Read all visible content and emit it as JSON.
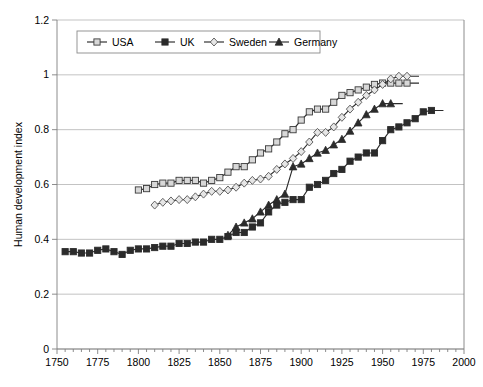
{
  "chart_data": {
    "type": "line",
    "title": "",
    "xlabel": "",
    "ylabel": "Human development index",
    "xlim": [
      1750,
      2000
    ],
    "ylim": [
      0,
      1.2
    ],
    "xticks": [
      1750,
      1775,
      1800,
      1825,
      1850,
      1875,
      1900,
      1925,
      1950,
      1975,
      2000
    ],
    "yticks": [
      0,
      0.2,
      0.4,
      0.6,
      0.8,
      1,
      1.2
    ],
    "xtick_labels": [
      "1750",
      "1775",
      "1800",
      "1825",
      "1850",
      "1875",
      "1900",
      "1925",
      "1950",
      "1975",
      "2000"
    ],
    "ytick_labels": [
      "0",
      "0.2",
      "0.4",
      "0.6",
      "0.8",
      "1",
      "1.2"
    ],
    "minor_xtick_step": 5,
    "grid": "horizontal",
    "legend_position": "top-center",
    "series": [
      {
        "name": "USA",
        "marker": "open-square",
        "color": "#2b2b2b",
        "marker_fill": "#d8d8d8",
        "x": [
          1800,
          1805,
          1810,
          1815,
          1820,
          1825,
          1830,
          1835,
          1840,
          1845,
          1850,
          1855,
          1860,
          1865,
          1870,
          1875,
          1880,
          1885,
          1890,
          1895,
          1900,
          1905,
          1910,
          1915,
          1920,
          1925,
          1930,
          1935,
          1940,
          1945,
          1950,
          1955,
          1960,
          1965
        ],
        "y": [
          0.58,
          0.585,
          0.6,
          0.605,
          0.605,
          0.615,
          0.615,
          0.615,
          0.605,
          0.615,
          0.625,
          0.645,
          0.665,
          0.665,
          0.69,
          0.715,
          0.73,
          0.755,
          0.785,
          0.8,
          0.835,
          0.865,
          0.875,
          0.875,
          0.9,
          0.925,
          0.935,
          0.945,
          0.955,
          0.965,
          0.97,
          0.97,
          0.97,
          0.97
        ]
      },
      {
        "name": "UK",
        "marker": "filled-square",
        "color": "#2b2b2b",
        "marker_fill": "#2b2b2b",
        "x": [
          1755,
          1760,
          1765,
          1770,
          1775,
          1780,
          1785,
          1790,
          1795,
          1800,
          1805,
          1810,
          1815,
          1820,
          1825,
          1830,
          1835,
          1840,
          1845,
          1850,
          1855,
          1860,
          1865,
          1870,
          1875,
          1880,
          1885,
          1890,
          1895,
          1900,
          1905,
          1910,
          1915,
          1920,
          1925,
          1930,
          1935,
          1940,
          1945,
          1950,
          1955,
          1960,
          1965,
          1970,
          1975,
          1980
        ],
        "y": [
          0.355,
          0.355,
          0.35,
          0.35,
          0.36,
          0.365,
          0.355,
          0.345,
          0.36,
          0.365,
          0.365,
          0.37,
          0.375,
          0.375,
          0.385,
          0.385,
          0.39,
          0.39,
          0.4,
          0.4,
          0.41,
          0.425,
          0.425,
          0.445,
          0.46,
          0.5,
          0.525,
          0.535,
          0.545,
          0.545,
          0.59,
          0.6,
          0.615,
          0.64,
          0.655,
          0.685,
          0.7,
          0.715,
          0.715,
          0.76,
          0.8,
          0.81,
          0.825,
          0.84,
          0.865,
          0.87
        ]
      },
      {
        "name": "Sweden",
        "marker": "open-diamond",
        "color": "#606060",
        "marker_fill": "#e6e6e6",
        "x": [
          1810,
          1815,
          1820,
          1825,
          1830,
          1835,
          1840,
          1845,
          1850,
          1855,
          1860,
          1865,
          1870,
          1875,
          1880,
          1885,
          1890,
          1895,
          1900,
          1905,
          1910,
          1915,
          1920,
          1925,
          1930,
          1935,
          1940,
          1945,
          1950,
          1955,
          1960,
          1965
        ],
        "y": [
          0.525,
          0.535,
          0.54,
          0.545,
          0.545,
          0.555,
          0.565,
          0.575,
          0.575,
          0.58,
          0.59,
          0.605,
          0.615,
          0.62,
          0.63,
          0.655,
          0.675,
          0.695,
          0.72,
          0.755,
          0.79,
          0.79,
          0.81,
          0.845,
          0.875,
          0.9,
          0.925,
          0.945,
          0.965,
          0.985,
          0.995,
          0.995
        ]
      },
      {
        "name": "Germany",
        "marker": "filled-triangle",
        "color": "#2b2b2b",
        "marker_fill": "#2b2b2b",
        "x": [
          1855,
          1860,
          1865,
          1870,
          1875,
          1880,
          1885,
          1890,
          1895,
          1900,
          1905,
          1910,
          1915,
          1920,
          1925,
          1930,
          1935,
          1940,
          1945,
          1950,
          1955
        ],
        "y": [
          0.415,
          0.445,
          0.46,
          0.475,
          0.5,
          0.525,
          0.545,
          0.565,
          0.665,
          0.675,
          0.695,
          0.715,
          0.725,
          0.745,
          0.765,
          0.795,
          0.825,
          0.855,
          0.875,
          0.895,
          0.895
        ]
      }
    ]
  },
  "legend": {
    "items": [
      {
        "label": "USA",
        "marker": "open-square"
      },
      {
        "label": "UK",
        "marker": "filled-square"
      },
      {
        "label": "Sweden",
        "marker": "open-diamond"
      },
      {
        "label": "Germany",
        "marker": "filled-triangle"
      }
    ]
  },
  "axes": {
    "y_title": "Human development index"
  }
}
